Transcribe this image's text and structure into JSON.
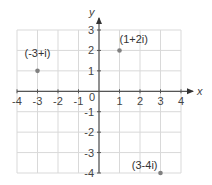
{
  "chart_data": {
    "type": "scatter",
    "title": "",
    "xlabel": "x",
    "ylabel": "y",
    "xlim": [
      -4,
      4
    ],
    "ylim": [
      -4,
      3
    ],
    "grid": true,
    "x_ticks": [
      -4,
      -3,
      -2,
      -1,
      1,
      2,
      3,
      4
    ],
    "x_tick_labels": [
      "-4",
      "-3",
      "-2",
      "-1",
      "1",
      "2",
      "3",
      "4"
    ],
    "y_ticks": [
      3,
      2,
      1,
      -1,
      -2,
      -3,
      -4
    ],
    "y_tick_labels": [
      "3",
      "2",
      "1",
      "-1",
      "-2",
      "-3",
      "-4"
    ],
    "origin_label": "0",
    "points": [
      {
        "x": -3,
        "y": 1,
        "label": "(-3+i)",
        "label_position": "above-left"
      },
      {
        "x": 1,
        "y": 2,
        "label": "(1+2i)",
        "label_position": "above-right"
      },
      {
        "x": 3,
        "y": -4,
        "label": "(3-4i)",
        "label_position": "above-left"
      }
    ],
    "colors": {
      "grid": "#d9d9d9",
      "axis": "#555555",
      "point": "#808080",
      "text": "#444444"
    }
  }
}
